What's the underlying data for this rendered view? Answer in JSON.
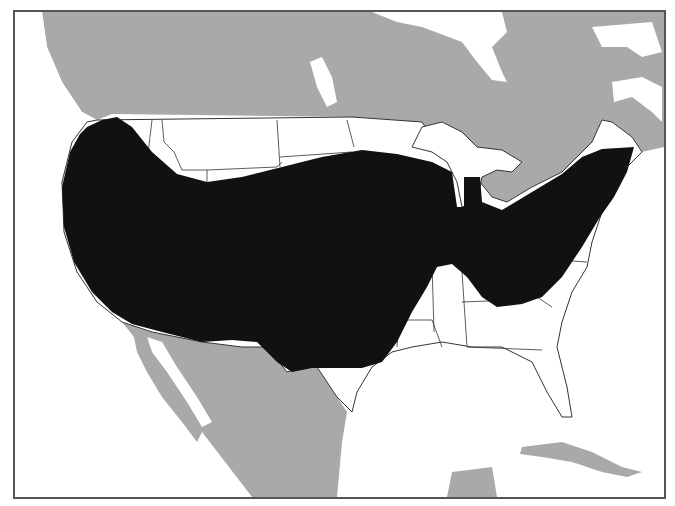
{
  "map": {
    "type": "species-range-map",
    "region": "North America (contiguous United States, southern Canada, northern Mexico, Caribbean)",
    "colors": {
      "range_fill": "#111111",
      "other_land": "#a9a9a9",
      "us_land": "#ffffff",
      "water": "#ffffff",
      "border": "#555555"
    },
    "layers": [
      {
        "name": "range",
        "label": "Shaded range area",
        "color": "#111111"
      },
      {
        "name": "us-states",
        "label": "US state boundaries",
        "color": "#ffffff"
      },
      {
        "name": "surrounding-land",
        "label": "Canada, Mexico, Cuba",
        "color": "#a9a9a9"
      }
    ],
    "labels": []
  }
}
